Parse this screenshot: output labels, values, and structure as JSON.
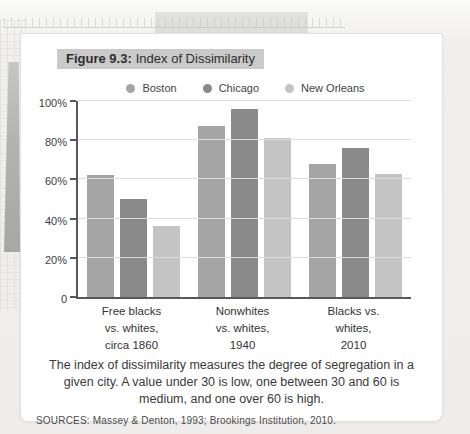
{
  "figure": {
    "label": "Figure 9.3:",
    "title": "Index of Dissimilarity"
  },
  "caption": "The index of dissimilarity measures the degree of segregation in a given city. A value under 30 is low, one between 30 and 60 is medium, and one over 60 is high.",
  "sources": "SOURCES: Massey & Denton, 1993; Brookings Institution, 2010.",
  "chart_data": {
    "type": "bar",
    "title": "Index of Dissimilarity",
    "categories": [
      "Free blacks vs. whites, circa 1860",
      "Nonwhites vs. whites, 1940",
      "Blacks vs. whites, 2010"
    ],
    "category_lines": [
      [
        "Free blacks",
        "vs. whites,",
        "circa 1860"
      ],
      [
        "Nonwhites",
        "vs. whites,",
        "1940"
      ],
      [
        "Blacks vs.",
        "whites,",
        "2010"
      ]
    ],
    "series": [
      {
        "name": "Boston",
        "color": "#a5a5a5",
        "values": [
          62,
          87,
          68
        ]
      },
      {
        "name": "Chicago",
        "color": "#8a8a8a",
        "values": [
          50,
          96,
          76
        ]
      },
      {
        "name": "New Orleans",
        "color": "#c4c4c4",
        "values": [
          36,
          81,
          63
        ]
      }
    ],
    "unit": "%",
    "ylim": [
      0,
      100
    ],
    "ytick_values": [
      100,
      80,
      60,
      40,
      20,
      0
    ],
    "ytick_labels": [
      "100%",
      "80%",
      "60%",
      "40%",
      "20%",
      "0"
    ],
    "grid": true,
    "legend_position": "top"
  },
  "colors": {
    "highlight_bg": "#cacaca",
    "axis": "#58585a",
    "gridline": "#dcdcdc",
    "card_bg": "#ffffff"
  }
}
